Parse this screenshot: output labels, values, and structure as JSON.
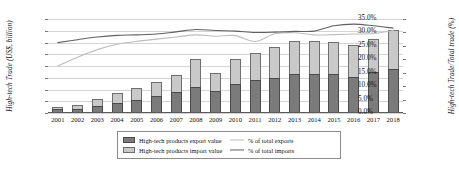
{
  "chart_data": {
    "type": "bar",
    "title": "",
    "subtitle": "",
    "xlabel": "",
    "ylabel": "High-tech Trade (US$, billion)",
    "ylabel_secondary": "High-tech Trade/Total trade (%)",
    "categories": [
      "2001",
      "2002",
      "2003",
      "2004",
      "2005",
      "2006",
      "2007",
      "2008",
      "2009",
      "2010",
      "2011",
      "2012",
      "2013",
      "2014",
      "2015",
      "2016",
      "2017",
      "2018"
    ],
    "ylim": [
      0,
      1600
    ],
    "ylim_secondary": [
      0,
      35
    ],
    "yticks": [
      "0",
      "200",
      "400",
      "600",
      "800",
      "1000",
      "1200",
      "1400",
      "1600"
    ],
    "yticks_secondary": [
      "0.0%",
      "5.0%",
      "10.0%",
      "15.0%",
      "20.0%",
      "25.0%",
      "30.0%",
      "35.0%"
    ],
    "grid": true,
    "legend_position": "bottom",
    "stacked": true,
    "series": [
      {
        "name": "High-tech products export value",
        "type": "bar",
        "axis": "left",
        "color": "#7b7b7b",
        "values": [
          65,
          75,
          115,
          165,
          220,
          285,
          350,
          435,
          375,
          500,
          555,
          600,
          670,
          670,
          665,
          620,
          690,
          755
        ]
      },
      {
        "name": "High-tech products import value",
        "type": "bar",
        "axis": "left",
        "color": "#c9c9c9",
        "values": [
          45,
          65,
          125,
          170,
          210,
          245,
          300,
          485,
          310,
          420,
          465,
          520,
          560,
          555,
          545,
          535,
          570,
          650
        ]
      },
      {
        "name": "% of total exports",
        "type": "line",
        "axis": "right",
        "color": "#bdbdbd",
        "values": [
          17.5,
          20.8,
          23.6,
          25.6,
          26.7,
          27.5,
          28.3,
          29.1,
          28.6,
          28.8,
          26.6,
          29.5,
          29.9,
          29.1,
          29.2,
          29.4,
          29.6,
          30.7
        ]
      },
      {
        "name": "% of total imports",
        "type": "line",
        "axis": "right",
        "color": "#5f5f5f",
        "values": [
          26.2,
          27.3,
          28.3,
          28.9,
          29.1,
          29.4,
          30.2,
          31.1,
          30.7,
          30.5,
          30.0,
          30.1,
          30.4,
          30.5,
          32.5,
          33.1,
          32.5,
          31.6
        ]
      }
    ]
  },
  "axes": {
    "left_title": "High-tech Trade (US$, billion)",
    "right_title": "High-tech Trade/Total trade (%)"
  },
  "legend": {
    "items": [
      {
        "label": "High-tech products export value",
        "marker": "bar-dark-swatch"
      },
      {
        "label": "% of total exports",
        "marker": "line-light-swatch"
      },
      {
        "label": "High-tech products import value",
        "marker": "bar-light-swatch"
      },
      {
        "label": "% of total imports",
        "marker": "line-dark-swatch"
      }
    ]
  }
}
